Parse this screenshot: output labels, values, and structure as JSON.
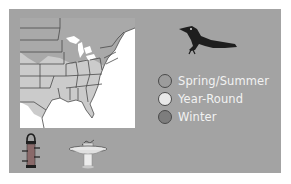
{
  "range_map": {
    "region": "Eastern United States",
    "colors": {
      "panel": "#a3a3a3",
      "water": "#ffffff",
      "spring_summer": "#a9a9a9",
      "year_round": "#cbcbcb",
      "winter": "#7f7f7f",
      "border": "#4a4a4a"
    }
  },
  "bird": {
    "icon": "grackle-silhouette-icon"
  },
  "legend": {
    "items": [
      {
        "label": "Spring/Summer",
        "color": "#9c9c9c"
      },
      {
        "label": "Year-Round",
        "color": "#e8e8e8"
      },
      {
        "label": "Winter",
        "color": "#7d7d7d"
      }
    ]
  },
  "attractants": {
    "items": [
      {
        "icon": "tube-feeder-icon"
      },
      {
        "icon": "birdbath-icon"
      }
    ]
  }
}
